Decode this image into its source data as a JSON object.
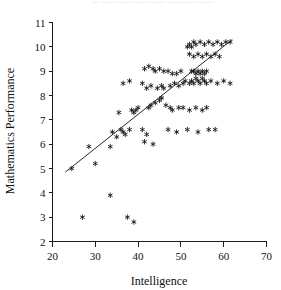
{
  "figure": {
    "top_fragment_text": "— ——  —— ——  —— ———— ——",
    "background_color": "#ffffff",
    "ink_color": "#101010"
  },
  "chart_data": {
    "type": "scatter",
    "title": "",
    "xlabel": "Intelligence",
    "ylabel": "Mathematics Performance",
    "xlim": [
      20,
      70
    ],
    "ylim": [
      2,
      11
    ],
    "xticks": [
      20,
      30,
      40,
      50,
      60,
      70
    ],
    "yticks": [
      2,
      3,
      4,
      5,
      6,
      7,
      8,
      9,
      10,
      11
    ],
    "xtick_labels": [
      "20",
      "30",
      "40",
      "50",
      "60",
      "70"
    ],
    "ytick_labels": [
      "2",
      "3",
      "4",
      "5",
      "6",
      "7",
      "8",
      "9",
      "10",
      "11"
    ],
    "grid": false,
    "legend": null,
    "marker_symbol": "asterisk",
    "marker_color": "#101010",
    "series": [
      {
        "name": "Students",
        "marker": "asterisk",
        "points": [
          [
            27.0,
            3.0
          ],
          [
            30.0,
            5.2
          ],
          [
            33.5,
            3.9
          ],
          [
            37.5,
            3.0
          ],
          [
            39.0,
            2.8
          ],
          [
            24.5,
            5.0
          ],
          [
            28.5,
            5.9
          ],
          [
            34.0,
            6.5
          ],
          [
            35.0,
            6.3
          ],
          [
            36.0,
            6.6
          ],
          [
            36.5,
            6.5
          ],
          [
            37.0,
            6.4
          ],
          [
            38.0,
            6.6
          ],
          [
            35.5,
            7.3
          ],
          [
            33.5,
            5.9
          ],
          [
            41.0,
            6.6
          ],
          [
            42.0,
            6.4
          ],
          [
            41.5,
            6.1
          ],
          [
            43.5,
            6.0
          ],
          [
            39.5,
            7.4
          ],
          [
            40.0,
            7.5
          ],
          [
            38.5,
            7.4
          ],
          [
            39.0,
            7.3
          ],
          [
            42.5,
            7.5
          ],
          [
            43.0,
            7.6
          ],
          [
            44.0,
            7.7
          ],
          [
            45.0,
            7.8
          ],
          [
            45.5,
            7.9
          ],
          [
            46.5,
            7.6
          ],
          [
            47.5,
            7.5
          ],
          [
            48.0,
            7.4
          ],
          [
            49.5,
            7.5
          ],
          [
            50.5,
            7.5
          ],
          [
            52.0,
            7.4
          ],
          [
            53.5,
            7.5
          ],
          [
            55.0,
            7.4
          ],
          [
            56.0,
            7.5
          ],
          [
            47.0,
            6.6
          ],
          [
            49.0,
            6.5
          ],
          [
            51.5,
            6.6
          ],
          [
            54.0,
            6.5
          ],
          [
            56.5,
            6.6
          ],
          [
            58.0,
            6.6
          ],
          [
            44.5,
            8.3
          ],
          [
            45.5,
            8.4
          ],
          [
            46.0,
            8.3
          ],
          [
            43.0,
            8.4
          ],
          [
            42.0,
            8.3
          ],
          [
            41.0,
            8.5
          ],
          [
            47.5,
            8.4
          ],
          [
            48.5,
            8.5
          ],
          [
            49.5,
            8.4
          ],
          [
            50.5,
            8.5
          ],
          [
            51.0,
            8.6
          ],
          [
            52.0,
            8.5
          ],
          [
            52.5,
            8.6
          ],
          [
            53.0,
            8.5
          ],
          [
            53.5,
            8.7
          ],
          [
            54.0,
            8.6
          ],
          [
            54.5,
            8.5
          ],
          [
            55.0,
            8.7
          ],
          [
            55.5,
            8.6
          ],
          [
            56.0,
            8.5
          ],
          [
            53.0,
            9.0
          ],
          [
            53.5,
            8.9
          ],
          [
            54.0,
            9.0
          ],
          [
            54.5,
            8.9
          ],
          [
            55.0,
            9.0
          ],
          [
            55.5,
            8.9
          ],
          [
            56.0,
            9.0
          ],
          [
            52.5,
            9.0
          ],
          [
            57.0,
            8.6
          ],
          [
            58.5,
            8.5
          ],
          [
            60.0,
            8.6
          ],
          [
            61.5,
            8.5
          ],
          [
            38.0,
            8.6
          ],
          [
            36.5,
            8.5
          ],
          [
            50.0,
            9.0
          ],
          [
            49.0,
            8.9
          ],
          [
            48.0,
            8.9
          ],
          [
            47.0,
            9.0
          ],
          [
            46.0,
            9.0
          ],
          [
            45.0,
            9.1
          ],
          [
            44.0,
            9.0
          ],
          [
            43.5,
            9.1
          ],
          [
            42.5,
            9.2
          ],
          [
            41.5,
            9.1
          ],
          [
            51.5,
            10.0
          ],
          [
            52.0,
            10.1
          ],
          [
            52.5,
            10.0
          ],
          [
            53.0,
            10.2
          ],
          [
            53.5,
            10.1
          ],
          [
            54.5,
            10.2
          ],
          [
            55.5,
            10.1
          ],
          [
            56.5,
            10.2
          ],
          [
            57.5,
            10.1
          ],
          [
            58.5,
            10.2
          ],
          [
            59.5,
            10.1
          ],
          [
            60.5,
            10.2
          ],
          [
            61.5,
            10.2
          ],
          [
            52.0,
            9.7
          ],
          [
            53.0,
            9.6
          ],
          [
            54.0,
            9.7
          ],
          [
            55.0,
            9.6
          ],
          [
            56.0,
            9.7
          ],
          [
            57.0,
            9.6
          ],
          [
            58.0,
            9.7
          ],
          [
            59.0,
            9.6
          ]
        ]
      }
    ],
    "trendline": {
      "name": "least-squares fit",
      "x_start": 23.0,
      "y_start": 4.85,
      "x_end": 62.0,
      "y_end": 10.3,
      "color": "#262626"
    }
  }
}
